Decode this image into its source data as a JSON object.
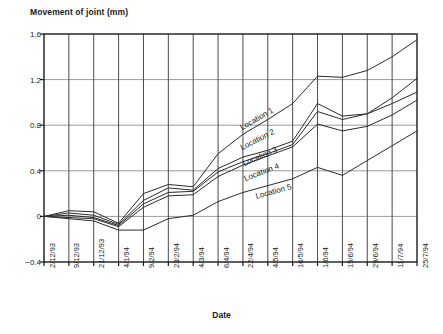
{
  "chart_data": {
    "type": "line",
    "title": "Movement of joint (mm)",
    "xlabel": "Date",
    "ylabel": "Movement of joint (mm)",
    "ylim": [
      -0.4,
      1.6
    ],
    "yticks": [
      "-0.4",
      "0",
      "0.4",
      "0.8",
      "1.2",
      "1.6"
    ],
    "ytick_values": [
      -0.4,
      0,
      0.4,
      0.8,
      1.2,
      1.6
    ],
    "grid": true,
    "legend_position": "inline-labels",
    "categories": [
      "2/12/93",
      "9/12/93",
      "21/12/93",
      "4/1/94",
      "9/2/94",
      "23/2/94",
      "4/3/94",
      "6/4/94",
      "22/4/94",
      "4/5/94",
      "16/5/94",
      "1/6/94",
      "15/6/94",
      "29/6/94",
      "11/7/94",
      "25/7/94"
    ],
    "series": [
      {
        "name": "Location 1",
        "values": [
          0.0,
          0.05,
          0.04,
          -0.06,
          0.2,
          0.28,
          0.26,
          0.55,
          0.72,
          0.85,
          0.99,
          1.23,
          1.22,
          1.28,
          1.4,
          1.55
        ]
      },
      {
        "name": "Location 2",
        "values": [
          0.0,
          0.03,
          0.01,
          -0.07,
          0.14,
          0.25,
          0.23,
          0.42,
          0.52,
          0.58,
          0.66,
          0.99,
          0.88,
          0.9,
          1.04,
          1.21
        ]
      },
      {
        "name": "Location 3",
        "values": [
          0.0,
          0.01,
          -0.01,
          -0.08,
          0.11,
          0.21,
          0.22,
          0.39,
          0.48,
          0.55,
          0.63,
          0.92,
          0.85,
          0.9,
          0.99,
          1.09
        ]
      },
      {
        "name": "Location 4",
        "values": [
          0.0,
          -0.01,
          -0.02,
          -0.09,
          0.08,
          0.18,
          0.19,
          0.35,
          0.45,
          0.53,
          0.61,
          0.81,
          0.75,
          0.79,
          0.89,
          1.02
        ]
      },
      {
        "name": "Location 5",
        "values": [
          0.0,
          -0.02,
          -0.04,
          -0.12,
          -0.12,
          -0.02,
          0.01,
          0.13,
          0.21,
          0.27,
          0.33,
          0.43,
          0.36,
          0.49,
          0.62,
          0.75
        ]
      }
    ]
  },
  "axis_labels": {
    "y_title": "Movement of joint (mm)",
    "x_title": "Date"
  }
}
